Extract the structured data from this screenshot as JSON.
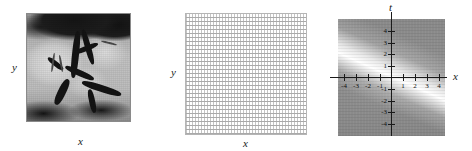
{
  "figure": {
    "panels": [
      {
        "id": "image-panel",
        "kind": "grayscale-image",
        "axis_x_label": "x",
        "axis_y_label": "y"
      },
      {
        "id": "grid-panel",
        "kind": "mesh-grid",
        "axis_x_label": "x",
        "axis_y_label": "y"
      },
      {
        "id": "plot-panel",
        "kind": "gradient-plot",
        "axis_x_label": "x",
        "axis_y_label": "t"
      }
    ]
  },
  "chart_data": {
    "type": "heatmap",
    "title": "",
    "xlabel": "x",
    "ylabel": "t",
    "xlim": [
      -5,
      5
    ],
    "ylim": [
      -5,
      5
    ],
    "grid": false,
    "legend": null,
    "x_ticks": [
      -4,
      -3,
      -2,
      -1,
      1,
      2,
      3,
      4
    ],
    "y_ticks": [
      4,
      3,
      2,
      1,
      -1,
      -2,
      -3,
      -4
    ],
    "x_tick_labels": [
      "-4",
      "-3",
      "-2",
      "-1",
      "1",
      "2",
      "3",
      "4"
    ],
    "y_tick_labels": [
      "4",
      "3",
      "2",
      "1",
      "-1",
      "-2",
      "-3",
      "-4"
    ],
    "background_gray": "#8d8d8d",
    "ridge_color": "#ffffff",
    "ridge_angle_deg": 24
  },
  "panel_image": {
    "label_y": "y",
    "label_x": "x",
    "border_color": "#8a8a8a",
    "description": "Grayscale angiography-style image showing dark branching vessel structures over a light mid-gray background."
  },
  "panel_grid": {
    "label_y": "y",
    "label_x": "x",
    "border_color": "#b5b5b5",
    "line_color": "#a9a9a9",
    "description": "Dense fine rectangular mesh grid filling a square frame."
  },
  "panel_plot": {
    "label_t": "t",
    "label_x": "x",
    "x_ticks": [
      {
        "label": "-4",
        "px": 344
      },
      {
        "label": "-3",
        "px": 356
      },
      {
        "label": "-2",
        "px": 368
      },
      {
        "label": "-1",
        "px": 380
      },
      {
        "label": "1",
        "px": 403
      },
      {
        "label": "2",
        "px": 415
      },
      {
        "label": "3",
        "px": 427
      },
      {
        "label": "4",
        "px": 439
      }
    ],
    "y_ticks": [
      {
        "label": "4",
        "px": 31
      },
      {
        "label": "3",
        "px": 43
      },
      {
        "label": "2",
        "px": 54
      },
      {
        "label": "1",
        "px": 66
      },
      {
        "label": "-1",
        "px": 89
      },
      {
        "label": "-2",
        "px": 101
      },
      {
        "label": "-3",
        "px": 112
      },
      {
        "label": "-4",
        "px": 124
      }
    ]
  }
}
